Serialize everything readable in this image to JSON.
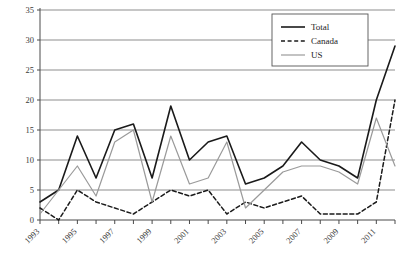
{
  "chart_data": {
    "type": "line",
    "title": "",
    "subtitle": "",
    "xlabel": "",
    "ylabel": "",
    "x": [
      1993,
      1994,
      1995,
      1996,
      1997,
      1998,
      1999,
      2000,
      2001,
      2002,
      2003,
      2004,
      2005,
      2006,
      2007,
      2008,
      2009,
      2010,
      2011,
      2012
    ],
    "categories": [
      "1993",
      "1994",
      "1995",
      "1996",
      "1997",
      "1998",
      "1999",
      "2000",
      "2001",
      "2002",
      "2003",
      "2004",
      "2005",
      "2006",
      "2007",
      "2008",
      "2009",
      "2010",
      "2011",
      "2012"
    ],
    "xtick_labels": [
      "1993",
      "1995",
      "1997",
      "1999",
      "2001",
      "2003",
      "2005",
      "2007",
      "2009",
      "2011"
    ],
    "xtick_values": [
      1993,
      1995,
      1997,
      1999,
      2001,
      2003,
      2005,
      2007,
      2009,
      2011
    ],
    "ytick_labels": [
      "0",
      "5",
      "10",
      "15",
      "20",
      "25",
      "30",
      "35"
    ],
    "ytick_values": [
      0,
      5,
      10,
      15,
      20,
      25,
      30,
      35
    ],
    "ylim": [
      0,
      35
    ],
    "xlim": [
      1993,
      2012
    ],
    "grid": true,
    "grid_axis": "y",
    "legend_position": "top-right",
    "series": [
      {
        "name": "Total",
        "style": "solid",
        "color": "#1a1a1a",
        "width": 1.6,
        "values": [
          3,
          5,
          14,
          7,
          15,
          16,
          7,
          19,
          10,
          13,
          14,
          6,
          7,
          9,
          13,
          10,
          9,
          7,
          20,
          29
        ]
      },
      {
        "name": "Canada",
        "style": "dashed",
        "color": "#1a1a1a",
        "width": 1.5,
        "values": [
          2,
          0,
          5,
          3,
          2,
          1,
          3,
          5,
          4,
          5,
          1,
          3,
          2,
          3,
          4,
          1,
          1,
          1,
          3,
          20
        ]
      },
      {
        "name": "US",
        "style": "solid",
        "color": "#9a9a9a",
        "width": 1.2,
        "values": [
          1,
          5,
          9,
          4,
          13,
          15,
          3,
          14,
          6,
          7,
          13,
          2,
          5,
          8,
          9,
          9,
          8,
          6,
          17,
          9
        ]
      }
    ]
  },
  "legend": {
    "items": [
      {
        "label": "Total"
      },
      {
        "label": "Canada"
      },
      {
        "label": "US"
      }
    ]
  },
  "axes": {
    "y_axis_name": "value-axis",
    "x_axis_name": "year-axis"
  },
  "colors": {
    "total": "#1a1a1a",
    "canada": "#1a1a1a",
    "us": "#9a9a9a",
    "grid": "#8d8d8d",
    "axis": "#4a4a4a",
    "text": "#3a3a3a",
    "background": "#ffffff"
  }
}
